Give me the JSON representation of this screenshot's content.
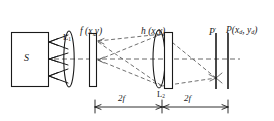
{
  "figure": {
    "type": "optical-system-diagram",
    "title": "",
    "stroke_color": "#1a1a1a",
    "dashed_color": "#555555",
    "background": "#ffffff"
  },
  "labels": {
    "source": "S",
    "lens1": "L",
    "lens1_sub": "1",
    "lens2": "L",
    "lens2_sub": "2",
    "object_plane": "f (x,y)",
    "filter_plane": "h (x,y)",
    "image_plane_prime": "P",
    "image_plane_prime_sup": "′",
    "detector_plane": "P(x",
    "detector_sub_1": "d",
    "detector_mid": ", y",
    "detector_sub_2": "d",
    "detector_end": ")"
  },
  "dimensions": {
    "span1_label": "2f",
    "span2_label": "2f",
    "span1_from_px": 95,
    "span1_to_px": 162,
    "span2_from_px": 163,
    "span2_to_px": 228,
    "baseline_y_px": 107
  },
  "elements": {
    "source_box": {
      "x": 11,
      "y": 32,
      "w": 37,
      "h": 54
    },
    "lens1": {
      "cx": 69,
      "cy": 59,
      "rx": 5,
      "ry": 28
    },
    "object_rect": {
      "x": 89,
      "y": 33,
      "w": 7,
      "h": 54
    },
    "lens2": {
      "cx": 160,
      "cy": 59,
      "rx": 6,
      "ry": 29
    },
    "filter_rect": {
      "x": 164,
      "y": 32,
      "w": 8,
      "h": 56
    },
    "plane_prime": {
      "x": 215,
      "y": 33,
      "w": 2,
      "h": 56
    },
    "plane_detector": {
      "x": 227,
      "y": 33,
      "w": 2,
      "h": 56
    },
    "optical_axis_y": 59
  },
  "arrow_clusters": [
    {
      "name": "upper",
      "tip_x": 49,
      "tip_y": 42
    },
    {
      "name": "middle",
      "tip_x": 49,
      "tip_y": 59
    },
    {
      "name": "lower",
      "tip_x": 49,
      "tip_y": 76
    }
  ]
}
